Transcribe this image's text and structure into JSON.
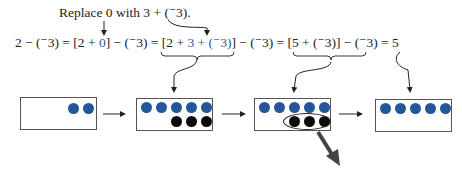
{
  "caption": {
    "text": "Replace 0 with 3 + (⁻3)."
  },
  "equation": {
    "part1": "2 − (⁻3) = [2 + ",
    "part1_zero": "0",
    "part2": "] − (⁻3) = ",
    "part3_open": "[2 + ",
    "part3_blue": "3 + (⁻3)",
    "part3_close": "]",
    "part4": " − (⁻3) = ",
    "part5": "[5 + (⁻3)] − (⁻3)",
    "part6": " = 5"
  },
  "models": [
    {
      "name": "two-positive",
      "blue_counters": 2,
      "black_counters": 0
    },
    {
      "name": "add-zero-pairs",
      "blue_counters": 5,
      "black_counters": 3
    },
    {
      "name": "remove-negatives",
      "blue_counters": 5,
      "black_counters": 3,
      "circled": "black counters removed"
    },
    {
      "name": "result-five",
      "blue_counters": 5,
      "black_counters": 0
    }
  ],
  "colors": {
    "blue_counter": "#24579a",
    "black_counter": "#0a0a0a",
    "highlight_text": "#2a5a9a"
  }
}
